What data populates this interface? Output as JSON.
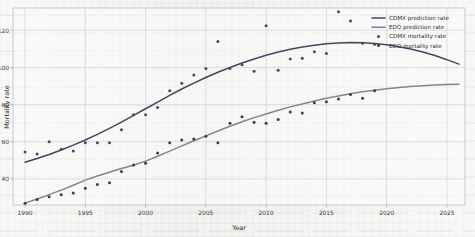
{
  "chart_data": {
    "type": "line",
    "title": "",
    "xlabel": "Year",
    "ylabel": "Mortality rate",
    "xlim": [
      1989.0,
      2026.5
    ],
    "ylim": [
      26,
      132
    ],
    "xticks": [
      1990,
      1995,
      2000,
      2005,
      2010,
      2015,
      2020,
      2025
    ],
    "yticks": [
      40,
      60,
      80,
      100,
      120
    ],
    "grid": true,
    "legend_position": "top-right",
    "colors": {
      "cdmx_line": "#3b4a63",
      "edo_line": "#7b8794",
      "cdmx_points": "#4a4a52",
      "edo_points": "#3c3c44",
      "grid": "#c6cedb",
      "panel": "#fbfbfa",
      "frame": "#b9bcc2"
    },
    "series": [
      {
        "name": "CDMX prediction rate",
        "kind": "line",
        "color": "#3b4a63",
        "x": [
          1990,
          1991,
          1992,
          1993,
          1994,
          1995,
          1996,
          1997,
          1998,
          1999,
          2000,
          2001,
          2002,
          2003,
          2004,
          2005,
          2006,
          2007,
          2008,
          2009,
          2010,
          2011,
          2012,
          2013,
          2014,
          2015,
          2016,
          2017,
          2018,
          2019,
          2020,
          2021,
          2022,
          2023,
          2024,
          2025,
          2026
        ],
        "values": [
          49.0,
          51.0,
          53.2,
          55.6,
          58.2,
          61.0,
          64.0,
          67.2,
          70.6,
          74.2,
          77.8,
          81.4,
          85.0,
          88.4,
          91.6,
          94.6,
          97.4,
          100.0,
          102.4,
          104.6,
          106.6,
          108.3,
          109.8,
          111.0,
          112.0,
          112.7,
          113.2,
          113.4,
          113.3,
          112.9,
          112.2,
          111.2,
          109.9,
          108.3,
          106.4,
          104.2,
          101.8
        ]
      },
      {
        "name": "EDO prediction rate",
        "kind": "line",
        "color": "#7b8794",
        "x": [
          1990,
          1991,
          1992,
          1993,
          1994,
          1995,
          1996,
          1997,
          1998,
          1999,
          2000,
          2001,
          2002,
          2003,
          2004,
          2005,
          2006,
          2007,
          2008,
          2009,
          2010,
          2011,
          2012,
          2013,
          2014,
          2015,
          2016,
          2017,
          2018,
          2019,
          2020,
          2021,
          2022,
          2023,
          2024,
          2025,
          2026
        ],
        "values": [
          27.0,
          29.2,
          31.6,
          34.0,
          36.6,
          39.4,
          41.6,
          43.6,
          45.6,
          47.4,
          49.6,
          52.2,
          55.0,
          57.8,
          60.6,
          63.2,
          65.8,
          68.4,
          70.8,
          73.0,
          75.0,
          77.0,
          78.8,
          80.4,
          82.0,
          83.4,
          84.7,
          85.9,
          86.9,
          87.8,
          88.6,
          89.2,
          89.8,
          90.2,
          90.6,
          90.9,
          91.0
        ]
      },
      {
        "name": "CDMX mortality rate",
        "kind": "scatter",
        "color": "#4a4a52",
        "x": [
          1990,
          1991,
          1992,
          1993,
          1994,
          1995,
          1996,
          1997,
          1998,
          1999,
          2000,
          2001,
          2002,
          2003,
          2004,
          2005,
          2006,
          2007,
          2008,
          2009,
          2010,
          2011,
          2012,
          2013,
          2014,
          2015,
          2016,
          2017,
          2018,
          2019
        ],
        "values": [
          54.5,
          53.5,
          60.0,
          56.0,
          55.0,
          59.5,
          59.5,
          59.5,
          66.5,
          74.5,
          74.5,
          78.5,
          87.5,
          91.5,
          96.0,
          99.5,
          114.0,
          99.5,
          101.5,
          98.0,
          122.5,
          98.5,
          104.5,
          105.0,
          108.5,
          107.5,
          130.0,
          125.0,
          113.0,
          112.5
        ]
      },
      {
        "name": "EDO mortality rate",
        "kind": "scatter",
        "color": "#3c3c44",
        "x": [
          1990,
          1991,
          1992,
          1993,
          1994,
          1995,
          1996,
          1997,
          1998,
          1999,
          2000,
          2001,
          2002,
          2003,
          2004,
          2005,
          2006,
          2007,
          2008,
          2009,
          2010,
          2011,
          2012,
          2013,
          2014,
          2015,
          2016,
          2017,
          2018,
          2019
        ],
        "values": [
          27.0,
          29.0,
          30.5,
          31.5,
          32.5,
          35.0,
          37.0,
          38.0,
          44.0,
          47.5,
          48.5,
          54.0,
          59.5,
          61.0,
          61.5,
          63.0,
          59.5,
          70.0,
          73.5,
          70.5,
          70.0,
          72.0,
          76.0,
          75.5,
          81.0,
          81.5,
          83.0,
          85.5,
          83.5,
          87.5
        ]
      }
    ]
  },
  "legend": {
    "items": [
      {
        "label": "CDMX prediction rate",
        "marker": "line"
      },
      {
        "label": "EDO prediction rate",
        "marker": "line"
      },
      {
        "label": "CDMX mortality rate",
        "marker": "dot"
      },
      {
        "label": "EDO mortality rate",
        "marker": "dot"
      }
    ]
  }
}
